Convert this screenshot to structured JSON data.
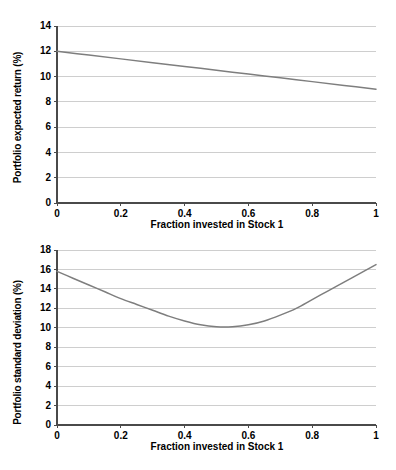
{
  "page": {
    "background": "#ffffff",
    "width": 396,
    "height": 470
  },
  "style": {
    "line_color": "#7e7e7e",
    "grid_color": "#c9c9c9",
    "axis_color": "#4a4a4a",
    "text_color": "#000000"
  },
  "chart_data": [
    {
      "id": "portfolio-expected-return",
      "type": "line",
      "title": "",
      "xlabel": "Fraction invested in Stock 1",
      "ylabel": "Portfolio expected return (%)",
      "xlim": [
        0,
        1
      ],
      "ylim": [
        0,
        14
      ],
      "grid": "horizontal",
      "legend": "none",
      "xticks": [
        0,
        0.2,
        0.4,
        0.6,
        0.8,
        1
      ],
      "xticklabels": [
        "0",
        "0.2",
        "0.4",
        "0.6",
        "0.8",
        "1"
      ],
      "yticks": [
        0,
        2,
        4,
        6,
        8,
        10,
        12,
        14
      ],
      "yticklabels": [
        "0",
        "2",
        "4",
        "6",
        "8",
        "10",
        "12",
        "14"
      ],
      "series": [
        {
          "name": "Portfolio expected return",
          "x": [
            0,
            0.1,
            0.2,
            0.3,
            0.4,
            0.5,
            0.6,
            0.7,
            0.8,
            0.9,
            1
          ],
          "values": [
            12.0,
            11.7,
            11.4,
            11.1,
            10.8,
            10.5,
            10.2,
            9.9,
            9.6,
            9.3,
            9.0
          ]
        }
      ]
    },
    {
      "id": "portfolio-standard-deviation",
      "type": "line",
      "title": "",
      "xlabel": "Fraction invested in Stock 1",
      "ylabel": "Portfolio standard deviation (%)",
      "xlim": [
        0,
        1
      ],
      "ylim": [
        0,
        18
      ],
      "grid": "horizontal",
      "legend": "none",
      "xticks": [
        0,
        0.2,
        0.4,
        0.6,
        0.8,
        1
      ],
      "xticklabels": [
        "0",
        "0.2",
        "0.4",
        "0.6",
        "0.8",
        "1"
      ],
      "yticks": [
        0,
        2,
        4,
        6,
        8,
        10,
        12,
        14,
        16,
        18
      ],
      "yticklabels": [
        "0",
        "2",
        "4",
        "6",
        "8",
        "10",
        "12",
        "14",
        "16",
        "18"
      ],
      "series": [
        {
          "name": "Portfolio standard deviation",
          "x": [
            0,
            0.05,
            0.1,
            0.15,
            0.2,
            0.25,
            0.3,
            0.35,
            0.4,
            0.45,
            0.5,
            0.55,
            0.6,
            0.65,
            0.7,
            0.75,
            0.8,
            0.85,
            0.9,
            0.95,
            1
          ],
          "values": [
            15.8,
            15.1,
            14.4,
            13.7,
            13.0,
            12.4,
            11.8,
            11.2,
            10.7,
            10.3,
            10.1,
            10.1,
            10.3,
            10.7,
            11.3,
            12.0,
            12.9,
            13.8,
            14.7,
            15.6,
            16.5
          ]
        }
      ]
    }
  ]
}
